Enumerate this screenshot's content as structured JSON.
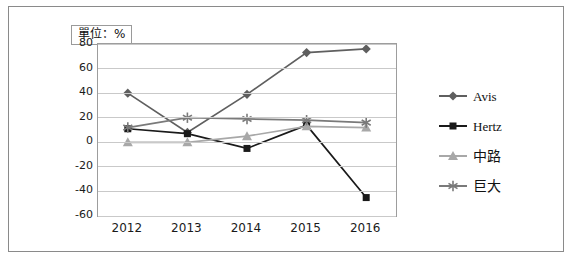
{
  "unit_label": "單位：%",
  "legend": [
    {
      "name": "Avis",
      "color": "#5f5f5f",
      "marker": "diamond",
      "is_cjk": false
    },
    {
      "name": "Hertz",
      "color": "#1a1a1a",
      "marker": "square",
      "is_cjk": false
    },
    {
      "name": "中路",
      "color": "#a8a8a8",
      "marker": "triangle",
      "is_cjk": true
    },
    {
      "name": "巨大",
      "color": "#7a7a7a",
      "marker": "asterisk",
      "is_cjk": true
    }
  ],
  "chart_data": {
    "type": "line",
    "title": "",
    "subtitle": "",
    "xlabel": "",
    "ylabel": "單位：%",
    "categories": [
      "2012",
      "2013",
      "2014",
      "2015",
      "2016"
    ],
    "ylim": [
      -60,
      80
    ],
    "yticks": [
      -60,
      -40,
      -20,
      0,
      20,
      40,
      60,
      80
    ],
    "grid": true,
    "legend_position": "right",
    "series": [
      {
        "name": "Avis",
        "color": "#5f5f5f",
        "marker": "diamond",
        "values": [
          40,
          8,
          39,
          73,
          76
        ]
      },
      {
        "name": "Hertz",
        "color": "#1a1a1a",
        "marker": "square",
        "values": [
          11,
          7,
          -5,
          14,
          -45
        ]
      },
      {
        "name": "中路",
        "color": "#a8a8a8",
        "marker": "triangle",
        "values": [
          0,
          0,
          5,
          13,
          12
        ]
      },
      {
        "name": "巨大",
        "color": "#7a7a7a",
        "marker": "asterisk",
        "values": [
          12,
          20,
          19,
          18,
          16
        ]
      }
    ]
  }
}
